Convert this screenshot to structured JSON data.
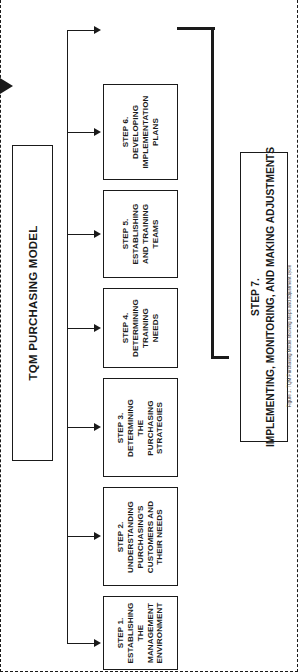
{
  "diagram": {
    "title": "TQM PURCHASING MODEL",
    "placeholder_box": {
      "label": "",
      "style": "dashed"
    },
    "steps": [
      {
        "id": "step1",
        "label": "STEP 1.\nESTABLISHING\nTHE\nMANAGEMENT\nENVIRONMENT"
      },
      {
        "id": "step2",
        "label": "STEP 2.\nUNDERSTANDING\nPURCHASING'S\nCUSTOMERS AND\nTHEIR NEEDS"
      },
      {
        "id": "step3",
        "label": "STEP 3.\nDETERMINING\nTHE\nPURCHASING\nSTRATEGIES"
      },
      {
        "id": "step4",
        "label": "STEP 4.\nDETERMINING\nTRAINING\nNEEDS"
      },
      {
        "id": "step5",
        "label": "STEP 5.\nESTABLISHING\nAND TRAINING\nTEAMS"
      },
      {
        "id": "step6",
        "label": "STEP 6.\nDEVELOPING\nIMPLEMENTATION\nPLANS"
      }
    ],
    "final_step": {
      "id": "step7",
      "label": "STEP 7.\nIMPLEMENTING, MONITORING, AND MAKING ADJUSTMENTS"
    },
    "caption": "Figure 1. TQM Purchasing Model showing steps and adjustment cycle",
    "colors": {
      "line": "#1a1a1a",
      "background": "#ffffff"
    }
  }
}
